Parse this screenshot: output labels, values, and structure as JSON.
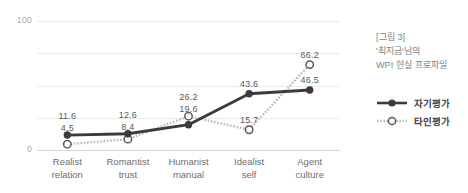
{
  "chart_data": {
    "type": "line",
    "title": "",
    "xlabel": "",
    "ylabel": "",
    "ylim": [
      0,
      100
    ],
    "yticks": [
      0,
      25,
      50,
      75,
      100
    ],
    "ytick_labels_shown": [
      "0",
      "100"
    ],
    "grid": true,
    "legend_position": "right",
    "categories": [
      "Realist\nrelation",
      "Romantist\ntrust",
      "Humanist\nmanual",
      "Idealist\nself",
      "Agent\nculture"
    ],
    "category_lines": [
      [
        "Realist",
        "relation"
      ],
      [
        "Romantist",
        "trust"
      ],
      [
        "Humanist",
        "manual"
      ],
      [
        "Idealist",
        "self"
      ],
      [
        "Agent",
        "culture"
      ]
    ],
    "series": [
      {
        "name": "자기평가",
        "style": "solid",
        "marker": "filled-circle",
        "color": "#3b3b3d",
        "values": [
          11.6,
          12.6,
          19.6,
          43.6,
          46.5
        ],
        "value_labels": [
          "11.6",
          "12.6",
          "19.6",
          "43.6",
          "46.5"
        ]
      },
      {
        "name": "타인평가",
        "style": "dotted",
        "marker": "open-circle",
        "color": "#b9babb",
        "values": [
          4.5,
          8.4,
          26.2,
          15.7,
          66.2
        ],
        "value_labels": [
          "4.5",
          "8.4",
          "26.2",
          "15.7",
          "66.2"
        ]
      }
    ]
  },
  "axis": {
    "y_top_label": "100",
    "y_bottom_label": "0"
  },
  "caption": {
    "line1": "[그림 3]",
    "line2": "'최지금'님의",
    "line3": "WPI 현실 프로파일"
  },
  "legend": {
    "items": [
      {
        "label": "자기평가",
        "icon": "solid-line-filled-circle-marker"
      },
      {
        "label": "타인평가",
        "icon": "dotted-line-open-circle-marker"
      }
    ]
  },
  "colors": {
    "self_series": "#3b3b3d",
    "other_series": "#b9babb",
    "gridline": "#ebebeb",
    "axis": "#d6d6d6",
    "value_label_text": "#58595b",
    "category_label_text": "#6d6e71",
    "tick_text": "#a8a8a8",
    "caption_text": "#808285",
    "background": "#ffffff"
  }
}
